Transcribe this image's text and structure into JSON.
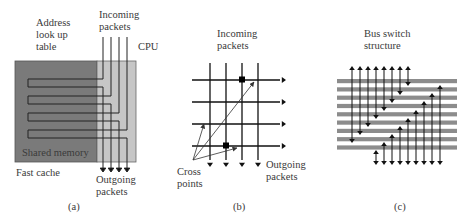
{
  "figure": {
    "panels": [
      {
        "id": "a",
        "caption": "(a)",
        "labels": {
          "address_table": [
            "Address",
            "look up",
            "table"
          ],
          "incoming": [
            "Incoming",
            "packets"
          ],
          "cpu": "CPU",
          "shared_memory": "Shared memory",
          "fast_cache": "Fast cache",
          "outgoing": [
            "Outgoing",
            "packets"
          ]
        },
        "colors": {
          "shared_memory": "#7a7a7a",
          "cpu": "#c4c4c4",
          "line": "#222222"
        },
        "channels": 4
      },
      {
        "id": "b",
        "caption": "(b)",
        "labels": {
          "incoming": [
            "Incoming",
            "packets"
          ],
          "cross_points": [
            "Cross",
            "points"
          ],
          "outgoing": [
            "Outgoing",
            "packets"
          ]
        },
        "grid_rows": 4,
        "grid_cols": 4,
        "highlighted_crosspoints": [
          {
            "row": 1,
            "col": 3
          },
          {
            "row": 4,
            "col": 2
          }
        ]
      },
      {
        "id": "c",
        "caption": "(c)",
        "labels": {
          "title": [
            "Bus switch",
            "structure"
          ]
        },
        "bus_count": 8,
        "colors": {
          "bus": "#8c8c8c"
        }
      }
    ]
  }
}
